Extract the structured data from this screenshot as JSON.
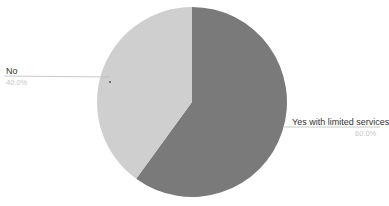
{
  "chart_data": {
    "type": "pie",
    "title": "",
    "categories": [
      "Yes with limited services",
      "No"
    ],
    "values": [
      60.0,
      40.0
    ],
    "value_labels": [
      "60.0%",
      "40.0%"
    ],
    "colors": [
      "#7a7a7a",
      "#cfcfcf"
    ],
    "start_angle_deg": 0,
    "direction": "clockwise",
    "legend": "none (callout labels)",
    "center": [
      192,
      102
    ],
    "radius": 95
  },
  "labels": {
    "no": {
      "name": "No",
      "percent": "40.0%"
    },
    "yes": {
      "name": "Yes with limited services",
      "percent": "60.0%"
    }
  }
}
